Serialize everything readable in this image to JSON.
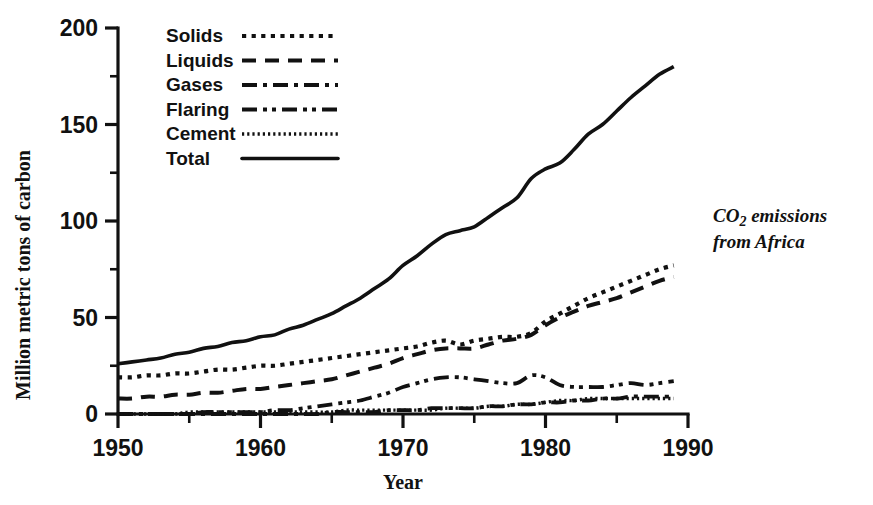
{
  "chart_data": {
    "type": "line",
    "title": "",
    "annotation": {
      "line1_prefix": "CO",
      "line1_sub": "2",
      "line1_suffix": " emissions",
      "line2": "from Africa"
    },
    "xlabel": "Year",
    "ylabel": "Million metric tons of carbon",
    "xlim": [
      1950,
      1990
    ],
    "ylim": [
      0,
      200
    ],
    "grid": false,
    "legend_position": "top-left-inside",
    "xticks": [
      1950,
      1960,
      1970,
      1980,
      1990
    ],
    "xtick_labels": [
      "1950",
      "1960",
      "1970",
      "1980",
      "1990"
    ],
    "xticks_minor": [
      1955,
      1965,
      1975,
      1985
    ],
    "yticks": [
      0,
      50,
      100,
      150,
      200
    ],
    "ytick_labels": [
      "0",
      "50",
      "100",
      "150",
      "200"
    ],
    "yticks_minor": [
      25,
      75,
      125,
      175
    ],
    "x": [
      1950,
      1951,
      1952,
      1953,
      1954,
      1955,
      1956,
      1957,
      1958,
      1959,
      1960,
      1961,
      1962,
      1963,
      1964,
      1965,
      1966,
      1967,
      1968,
      1969,
      1970,
      1971,
      1972,
      1973,
      1974,
      1975,
      1976,
      1977,
      1978,
      1979,
      1980,
      1981,
      1982,
      1983,
      1984,
      1985,
      1986,
      1987,
      1988,
      1989
    ],
    "series": [
      {
        "name": "Solids",
        "style": "dotted",
        "values": [
          19,
          19,
          20,
          20,
          21,
          21,
          22,
          23,
          23,
          24,
          25,
          25,
          26,
          27,
          28,
          29,
          30,
          31,
          32,
          33,
          34,
          35,
          37,
          38,
          36,
          38,
          39,
          40,
          40,
          42,
          48,
          52,
          56,
          60,
          63,
          66,
          69,
          72,
          75,
          77
        ]
      },
      {
        "name": "Liquids",
        "style": "dashed",
        "values": [
          8,
          8,
          9,
          9,
          10,
          10,
          11,
          11,
          12,
          13,
          13,
          14,
          15,
          16,
          17,
          18,
          20,
          22,
          24,
          26,
          29,
          31,
          33,
          34,
          34,
          34,
          36,
          38,
          39,
          41,
          46,
          50,
          53,
          56,
          58,
          60,
          63,
          66,
          69,
          71
        ]
      },
      {
        "name": "Gases",
        "style": "dashdot",
        "values": [
          0,
          0,
          0,
          0,
          0,
          0,
          0,
          0,
          0,
          0,
          0,
          0,
          0,
          0,
          0,
          1,
          1,
          1,
          1,
          2,
          2,
          2,
          3,
          3,
          3,
          3,
          4,
          4,
          5,
          5,
          6,
          6,
          7,
          7,
          8,
          8,
          9,
          9,
          9,
          9
        ]
      },
      {
        "name": "Flaring",
        "style": "dashdotdot",
        "values": [
          0,
          0,
          0,
          0,
          0,
          0,
          1,
          1,
          1,
          1,
          1,
          2,
          2,
          3,
          4,
          5,
          6,
          7,
          9,
          11,
          14,
          16,
          18,
          19,
          19,
          18,
          17,
          16,
          16,
          20,
          19,
          15,
          14,
          14,
          14,
          15,
          16,
          15,
          16,
          17
        ]
      },
      {
        "name": "Cement",
        "style": "finedotted",
        "values": [
          0,
          0,
          0,
          0,
          0,
          1,
          1,
          1,
          1,
          1,
          1,
          1,
          1,
          1,
          1,
          1,
          2,
          2,
          2,
          2,
          2,
          2,
          2,
          3,
          3,
          3,
          4,
          4,
          5,
          5,
          6,
          7,
          7,
          8,
          8,
          8,
          8,
          8,
          8,
          8
        ]
      },
      {
        "name": "Total",
        "style": "solid",
        "values": [
          26,
          27,
          28,
          29,
          31,
          32,
          34,
          35,
          37,
          38,
          40,
          41,
          44,
          46,
          49,
          52,
          56,
          60,
          65,
          70,
          77,
          82,
          88,
          93,
          95,
          97,
          102,
          107,
          112,
          122,
          127,
          130,
          137,
          145,
          150,
          157,
          164,
          170,
          176,
          180
        ]
      }
    ],
    "legend_entries": [
      {
        "label": "Solids",
        "style": "dotted"
      },
      {
        "label": "Liquids",
        "style": "dashed"
      },
      {
        "label": "Gases",
        "style": "dashdot"
      },
      {
        "label": "Flaring",
        "style": "dashdotdot"
      },
      {
        "label": "Cement",
        "style": "finedotted"
      },
      {
        "label": "Total",
        "style": "solid"
      }
    ],
    "colors": {
      "ink": "#111111",
      "background": "#ffffff"
    }
  }
}
